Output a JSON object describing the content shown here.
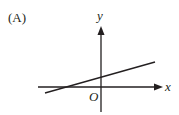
{
  "figure": {
    "option_label": "(A)",
    "x_axis_label": "x",
    "y_axis_label": "y",
    "origin_label": "O"
  },
  "graph": {
    "type": "linear-function-sketch",
    "line": {
      "slope_sign": "positive",
      "y_intercept_sign": "positive",
      "x_intercept_sign": "negative"
    },
    "stroke_color": "#231f20"
  }
}
